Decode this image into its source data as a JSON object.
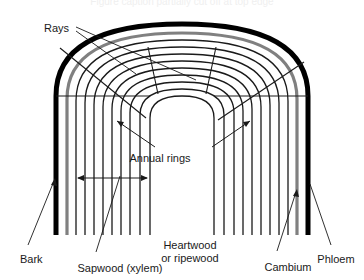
{
  "figure": {
    "top_cut_text": "Figure caption partially cut off at top edge",
    "colors": {
      "bark": "#000000",
      "cambium": "#808080",
      "rings": "#1a1a1a",
      "background": "#ffffff",
      "text": "#1a1a1a"
    },
    "labels": [
      {
        "id": "rays",
        "text": "Rays",
        "x": 44,
        "y": 22,
        "align": "left"
      },
      {
        "id": "annual",
        "text": "Annual rings",
        "x": 160,
        "y": 152,
        "align": "center"
      },
      {
        "id": "bark",
        "text": "Bark",
        "x": 20,
        "y": 253,
        "align": "left"
      },
      {
        "id": "sapwood",
        "text": "Sapwood (xylem)",
        "x": 120,
        "y": 262,
        "align": "center"
      },
      {
        "id": "heartwood1",
        "text": "Heartwood",
        "x": 190,
        "y": 239,
        "align": "center"
      },
      {
        "id": "heartwood2",
        "text": "or ripewood",
        "x": 190,
        "y": 252,
        "align": "center"
      },
      {
        "id": "cambium",
        "text": "Cambium",
        "x": 288,
        "y": 261,
        "align": "center"
      },
      {
        "id": "phloem",
        "text": "Phloem",
        "x": 336,
        "y": 253,
        "align": "center"
      }
    ],
    "structure": {
      "description": "Nested inverted-U arches representing tree growth layers, with radial ray lines and a horizontal dimension arrow marking sapwood width.",
      "arch_count": 10,
      "bark_layer": "outermost heavy black arch",
      "cambium_layer": "gray arch just inside the bark",
      "annual_ring_layers": 8,
      "dimension_arrow": {
        "label": "sapwood width",
        "x1": 77,
        "x2": 148,
        "y": 178
      }
    }
  }
}
